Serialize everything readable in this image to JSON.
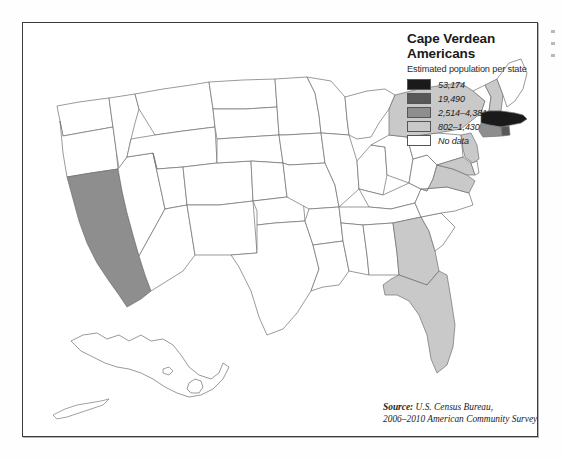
{
  "figure": {
    "title": "Cape Verdean Americans",
    "subtitle": "Estimated population per state",
    "source_label": "Source:",
    "source_text": " U.S. Census Bureau,",
    "source_line2": "2006–2010 American Community Survey"
  },
  "legend": {
    "items": [
      {
        "label": "53,174",
        "color": "#1a1a1a"
      },
      {
        "label": "19,490",
        "color": "#585858"
      },
      {
        "label": "2,514–4,381",
        "color": "#8e8e8e"
      },
      {
        "label": "802–1,430",
        "color": "#c9c9c9"
      },
      {
        "label": "No data",
        "color": "#ffffff"
      }
    ]
  },
  "chart_data": {
    "type": "map",
    "title": "Cape Verdean Americans",
    "subtitle": "Estimated population per state",
    "measure": "Estimated Cape Verdean American population per state",
    "source": "U.S. Census Bureau, 2006–2010 American Community Survey",
    "projection": "Albers USA (Alaska and Hawaii as insets)",
    "classes": [
      {
        "label": "53,174",
        "color": "#1a1a1a",
        "min": 53174,
        "max": 53174
      },
      {
        "label": "19,490",
        "color": "#585858",
        "min": 19490,
        "max": 19490
      },
      {
        "label": "2,514–4,381",
        "color": "#8e8e8e",
        "min": 2514,
        "max": 4381
      },
      {
        "label": "802–1,430",
        "color": "#c9c9c9",
        "min": 802,
        "max": 1430
      },
      {
        "label": "No data",
        "color": "#ffffff",
        "min": null,
        "max": null
      }
    ],
    "regions": [
      {
        "code": "MA",
        "name": "Massachusetts",
        "class": "53,174",
        "color": "#1a1a1a"
      },
      {
        "code": "RI",
        "name": "Rhode Island",
        "class": "19,490",
        "color": "#585858"
      },
      {
        "code": "CA",
        "name": "California",
        "class": "2,514–4,381",
        "color": "#8e8e8e"
      },
      {
        "code": "CT",
        "name": "Connecticut",
        "class": "2,514–4,381",
        "color": "#8e8e8e"
      },
      {
        "code": "FL",
        "name": "Florida",
        "class": "802–1,430",
        "color": "#c9c9c9"
      },
      {
        "code": "NY",
        "name": "New York",
        "class": "802–1,430",
        "color": "#c9c9c9"
      },
      {
        "code": "NJ",
        "name": "New Jersey",
        "class": "802–1,430",
        "color": "#c9c9c9"
      },
      {
        "code": "GA",
        "name": "Georgia",
        "class": "802–1,430",
        "color": "#c9c9c9"
      },
      {
        "code": "MD",
        "name": "Maryland",
        "class": "802–1,430",
        "color": "#c9c9c9"
      },
      {
        "code": "VA",
        "name": "Virginia",
        "class": "802–1,430",
        "color": "#c9c9c9"
      },
      {
        "code": "NH",
        "name": "New Hampshire",
        "class": "802–1,430",
        "color": "#c9c9c9"
      },
      {
        "code": "WA",
        "name": "Washington",
        "class": "No data",
        "color": "#ffffff"
      },
      {
        "code": "OR",
        "name": "Oregon",
        "class": "No data",
        "color": "#ffffff"
      },
      {
        "code": "ID",
        "name": "Idaho",
        "class": "No data",
        "color": "#ffffff"
      },
      {
        "code": "NV",
        "name": "Nevada",
        "class": "No data",
        "color": "#ffffff"
      },
      {
        "code": "MT",
        "name": "Montana",
        "class": "No data",
        "color": "#ffffff"
      },
      {
        "code": "WY",
        "name": "Wyoming",
        "class": "No data",
        "color": "#ffffff"
      },
      {
        "code": "UT",
        "name": "Utah",
        "class": "No data",
        "color": "#ffffff"
      },
      {
        "code": "AZ",
        "name": "Arizona",
        "class": "No data",
        "color": "#ffffff"
      },
      {
        "code": "CO",
        "name": "Colorado",
        "class": "No data",
        "color": "#ffffff"
      },
      {
        "code": "NM",
        "name": "New Mexico",
        "class": "No data",
        "color": "#ffffff"
      },
      {
        "code": "ND",
        "name": "North Dakota",
        "class": "No data",
        "color": "#ffffff"
      },
      {
        "code": "SD",
        "name": "South Dakota",
        "class": "No data",
        "color": "#ffffff"
      },
      {
        "code": "NE",
        "name": "Nebraska",
        "class": "No data",
        "color": "#ffffff"
      },
      {
        "code": "KS",
        "name": "Kansas",
        "class": "No data",
        "color": "#ffffff"
      },
      {
        "code": "OK",
        "name": "Oklahoma",
        "class": "No data",
        "color": "#ffffff"
      },
      {
        "code": "TX",
        "name": "Texas",
        "class": "No data",
        "color": "#ffffff"
      },
      {
        "code": "MN",
        "name": "Minnesota",
        "class": "No data",
        "color": "#ffffff"
      },
      {
        "code": "IA",
        "name": "Iowa",
        "class": "No data",
        "color": "#ffffff"
      },
      {
        "code": "MO",
        "name": "Missouri",
        "class": "No data",
        "color": "#ffffff"
      },
      {
        "code": "AR",
        "name": "Arkansas",
        "class": "No data",
        "color": "#ffffff"
      },
      {
        "code": "LA",
        "name": "Louisiana",
        "class": "No data",
        "color": "#ffffff"
      },
      {
        "code": "WI",
        "name": "Wisconsin",
        "class": "No data",
        "color": "#ffffff"
      },
      {
        "code": "IL",
        "name": "Illinois",
        "class": "No data",
        "color": "#ffffff"
      },
      {
        "code": "MI",
        "name": "Michigan",
        "class": "No data",
        "color": "#ffffff"
      },
      {
        "code": "IN",
        "name": "Indiana",
        "class": "No data",
        "color": "#ffffff"
      },
      {
        "code": "OH",
        "name": "Ohio",
        "class": "No data",
        "color": "#ffffff"
      },
      {
        "code": "KY",
        "name": "Kentucky",
        "class": "No data",
        "color": "#ffffff"
      },
      {
        "code": "TN",
        "name": "Tennessee",
        "class": "No data",
        "color": "#ffffff"
      },
      {
        "code": "MS",
        "name": "Mississippi",
        "class": "No data",
        "color": "#ffffff"
      },
      {
        "code": "AL",
        "name": "Alabama",
        "class": "No data",
        "color": "#ffffff"
      },
      {
        "code": "SC",
        "name": "South Carolina",
        "class": "No data",
        "color": "#ffffff"
      },
      {
        "code": "NC",
        "name": "North Carolina",
        "class": "No data",
        "color": "#ffffff"
      },
      {
        "code": "WV",
        "name": "West Virginia",
        "class": "No data",
        "color": "#ffffff"
      },
      {
        "code": "PA",
        "name": "Pennsylvania",
        "class": "No data",
        "color": "#ffffff"
      },
      {
        "code": "DE",
        "name": "Delaware",
        "class": "No data",
        "color": "#ffffff"
      },
      {
        "code": "VT",
        "name": "Vermont",
        "class": "No data",
        "color": "#ffffff"
      },
      {
        "code": "ME",
        "name": "Maine",
        "class": "No data",
        "color": "#ffffff"
      },
      {
        "code": "AK",
        "name": "Alaska",
        "class": "No data",
        "color": "#ffffff"
      },
      {
        "code": "HI",
        "name": "Hawaii",
        "class": "No data",
        "color": "#ffffff"
      }
    ]
  }
}
